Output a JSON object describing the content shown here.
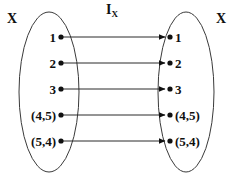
{
  "diagram": {
    "type": "identity-map-venn",
    "map_label": {
      "symbol": "I",
      "subscript": "X"
    },
    "left_set": {
      "name": "X",
      "label": "X",
      "elements": [
        "1",
        "2",
        "3",
        "(4,5)",
        "(5,4)"
      ]
    },
    "right_set": {
      "name": "X",
      "label": "X",
      "elements": [
        "1",
        "2",
        "3",
        "(4,5)",
        "(5,4)"
      ]
    },
    "mappings": [
      {
        "from": "1",
        "to": "1"
      },
      {
        "from": "2",
        "to": "2"
      },
      {
        "from": "3",
        "to": "3"
      },
      {
        "from": "(4,5)",
        "to": "(4,5)"
      },
      {
        "from": "(5,4)",
        "to": "(5,4)"
      }
    ],
    "colors": {
      "stroke": "#3a3a3a",
      "text": "#101010",
      "dot": "#101010",
      "background": "#ffffff"
    },
    "geometry": {
      "row_y": [
        37,
        63,
        89,
        115,
        141
      ],
      "left_dot_x": 61,
      "right_dot_x": 170,
      "left_ellipse": {
        "cx": 49,
        "cy": 92,
        "rx": 30,
        "ry": 80
      },
      "right_ellipse": {
        "cx": 186,
        "cy": 92,
        "rx": 28,
        "ry": 80
      }
    }
  }
}
